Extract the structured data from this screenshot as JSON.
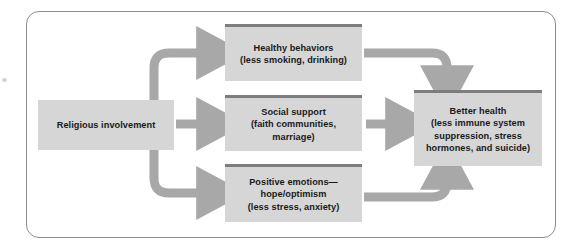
{
  "figure": {
    "type": "flow-diagram",
    "frame_color": "#8c8c8c",
    "box_fill_color": "#d6d6d6",
    "box_cap_color": "#7d7d7d",
    "arrow_color": "#a8a8a8",
    "text_color": "#1a1a1a",
    "background_color": "#ffffff"
  },
  "nodes": {
    "religious": {
      "id": "religious-involvement",
      "label": "Religious involvement",
      "lines": [
        "Religious involvement"
      ],
      "has_top_cap": false,
      "column": "left"
    },
    "healthy": {
      "id": "healthy-behaviors",
      "label": "Healthy behaviors (less smoking, drinking)",
      "lines": [
        "Healthy behaviors",
        "(less smoking, drinking)"
      ],
      "has_top_cap": true,
      "column": "middle"
    },
    "social": {
      "id": "social-support",
      "label": "Social support (faith communities, marriage)",
      "lines": [
        "Social support",
        "(faith communities,",
        "marriage)"
      ],
      "has_top_cap": true,
      "column": "middle"
    },
    "positive": {
      "id": "positive-emotions",
      "label": "Positive emotions—hope/optimism (less stress, anxiety)",
      "lines": [
        "Positive emotions—",
        "hope/optimism",
        "(less stress, anxiety)"
      ],
      "has_top_cap": true,
      "column": "middle"
    },
    "better": {
      "id": "better-health",
      "label": "Better health (less immune system suppression, stress hormones, and suicide)",
      "lines": [
        "Better health",
        "(less immune system",
        "suppression, stress",
        "hormones, and suicide)"
      ],
      "has_top_cap": true,
      "column": "right"
    }
  },
  "edges": [
    {
      "id": "religious-to-healthy",
      "from": "religious",
      "to": "healthy",
      "shape": "elbow-up",
      "direction": "right"
    },
    {
      "id": "religious-to-social",
      "from": "religious",
      "to": "social",
      "shape": "straight",
      "direction": "right"
    },
    {
      "id": "religious-to-positive",
      "from": "religious",
      "to": "positive",
      "shape": "elbow-down",
      "direction": "right"
    },
    {
      "id": "healthy-to-better",
      "from": "healthy",
      "to": "better",
      "shape": "elbow-down",
      "direction": "down"
    },
    {
      "id": "social-to-better",
      "from": "social",
      "to": "better",
      "shape": "straight",
      "direction": "right"
    },
    {
      "id": "positive-to-better",
      "from": "positive",
      "to": "better",
      "shape": "elbow-up",
      "direction": "up"
    }
  ]
}
